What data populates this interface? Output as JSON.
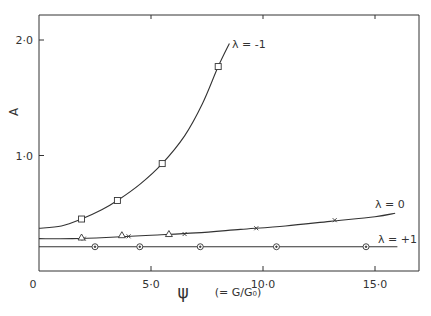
{
  "chart_data": {
    "type": "line",
    "title": "",
    "xlabel": "ψ",
    "xlabel_note": "(= G/G₀)",
    "ylabel": "A",
    "xlim": [
      0,
      17
    ],
    "ylim": [
      0,
      2.2
    ],
    "x_ticks": [
      "0",
      "5·0",
      "10·0",
      "15·0"
    ],
    "y_ticks": [
      "0",
      "1·0",
      "2·0"
    ],
    "grid": false,
    "legend_position": "inline labels at curve ends",
    "series": [
      {
        "name": "λ = -1",
        "marker": "square",
        "points": [
          [
            1.9,
            0.45
          ],
          [
            3.5,
            0.61
          ],
          [
            5.5,
            0.93
          ],
          [
            8.0,
            1.77
          ]
        ],
        "curve": [
          [
            0,
            0.37
          ],
          [
            1.0,
            0.39
          ],
          [
            1.9,
            0.45
          ],
          [
            2.8,
            0.53
          ],
          [
            3.5,
            0.61
          ],
          [
            4.5,
            0.75
          ],
          [
            5.5,
            0.93
          ],
          [
            6.5,
            1.17
          ],
          [
            7.3,
            1.45
          ],
          [
            8.0,
            1.77
          ],
          [
            8.5,
            1.97
          ]
        ]
      },
      {
        "name": "λ = 0",
        "marker": "cross",
        "points": [
          [
            2.0,
            0.28
          ],
          [
            4.0,
            0.3
          ],
          [
            6.5,
            0.32
          ],
          [
            9.7,
            0.37
          ],
          [
            13.2,
            0.44
          ]
        ],
        "triangles": [
          [
            1.9,
            0.29
          ],
          [
            3.7,
            0.31
          ],
          [
            5.8,
            0.32
          ]
        ],
        "curve": [
          [
            0,
            0.28
          ],
          [
            1.5,
            0.28
          ],
          [
            3.0,
            0.29
          ],
          [
            5.0,
            0.31
          ],
          [
            7.0,
            0.33
          ],
          [
            9.0,
            0.36
          ],
          [
            11.0,
            0.39
          ],
          [
            13.0,
            0.43
          ],
          [
            15.0,
            0.47
          ],
          [
            15.9,
            0.5
          ]
        ]
      },
      {
        "name": "λ = +1",
        "marker": "circle",
        "points": [
          [
            2.5,
            0.21
          ],
          [
            4.5,
            0.21
          ],
          [
            7.2,
            0.21
          ],
          [
            10.6,
            0.21
          ],
          [
            14.6,
            0.21
          ]
        ],
        "curve": [
          [
            0,
            0.21
          ],
          [
            16.0,
            0.21
          ]
        ]
      }
    ]
  }
}
